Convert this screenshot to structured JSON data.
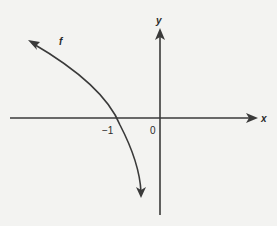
{
  "diagram": {
    "function_label": "f",
    "x_axis_label": "x",
    "y_axis_label": "y",
    "ticks": [
      {
        "label": "−1",
        "value": -1
      },
      {
        "label": "0",
        "value": 0
      }
    ],
    "colors": {
      "background": "#f3f3f1",
      "ink": "#3a3a3a"
    }
  }
}
